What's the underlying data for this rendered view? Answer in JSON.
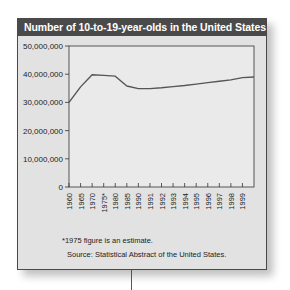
{
  "chart_data": {
    "type": "line",
    "title": "Number of 10-to-19-year-olds in the United States",
    "xlabel": "",
    "ylabel": "",
    "categories": [
      "1960",
      "1965",
      "1970",
      "1975*",
      "1980",
      "1985",
      "1990",
      "1991",
      "1992",
      "1993",
      "1994",
      "1995",
      "1996",
      "1997",
      "1998",
      "1999"
    ],
    "series": [
      {
        "name": "10-to-19-year-olds",
        "values": [
          30000000,
          35500000,
          39800000,
          39600000,
          39300000,
          35800000,
          34900000,
          34900000,
          35200000,
          35600000,
          36000000,
          36500000,
          37000000,
          37500000,
          38000000,
          38800000
        ]
      }
    ],
    "yticks": [
      "0",
      "10,000,000",
      "20,000,000",
      "30,000,000",
      "40,000,000",
      "50,000,000"
    ],
    "ylim": [
      0,
      50000000
    ],
    "grid": false,
    "legend": "none",
    "annotations": [
      "*1975 figure is an estimate.",
      "Source: Statistical Abstract of the United States."
    ]
  },
  "colors": {
    "title_bar": "#4a4a4a",
    "card_bg": "#e2e2e2",
    "plot_bg": "#eaeaea",
    "line": "#555555",
    "axis": "#333333"
  },
  "footnote": "*1975 figure is an estimate.",
  "source": "Source: Statistical Abstract of the United States."
}
